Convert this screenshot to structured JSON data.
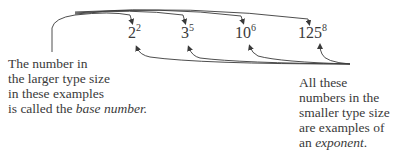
{
  "examples": [
    {
      "base": "2",
      "exponent": "2"
    },
    {
      "base": "3",
      "exponent": "5"
    },
    {
      "base": "10",
      "exponent": "6"
    },
    {
      "base": "125",
      "exponent": "8"
    }
  ],
  "left_caption": {
    "lines": [
      "The number in",
      "the larger type size",
      "in these examples"
    ],
    "last_line_prefix": "is called the ",
    "last_line_term": "base number",
    "last_line_suffix": "."
  },
  "right_caption": {
    "lines": [
      "All these",
      "numbers in the",
      "smaller type size",
      "are examples of"
    ],
    "last_line_prefix": "an ",
    "last_line_term": "exponent",
    "last_line_suffix": "."
  },
  "colors": {
    "text": "#3a3a3a",
    "arrow": "#3a3a3a",
    "background": "#ffffff"
  }
}
